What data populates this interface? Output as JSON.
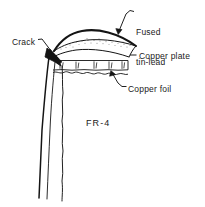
{
  "figure": {
    "background_color": "#ffffff",
    "ink_color": "#1a1a1a",
    "width": 205,
    "height": 207
  },
  "labels": {
    "fused_tin_lead_line1": "Fused",
    "fused_tin_lead_line2": "tin-lead",
    "copper_plate": "Copper plate",
    "copper_foil": "Copper foil",
    "crack": "Crack",
    "substrate": "FR-4"
  },
  "leader_lines": [
    {
      "name": "fused-tin-lead-leader",
      "from": [
        134,
        12
      ],
      "to": [
        119,
        32
      ],
      "arrow": true
    },
    {
      "name": "copper-plate-leader",
      "from": [
        137,
        55
      ],
      "to": [
        128,
        55
      ],
      "arrow": false
    },
    {
      "name": "copper-foil-leader",
      "from": [
        126,
        86
      ],
      "to": [
        111,
        72
      ],
      "arrow": true
    },
    {
      "name": "crack-leader",
      "from": [
        40,
        40
      ],
      "to": [
        53,
        54
      ],
      "arrow": false
    }
  ],
  "layers": [
    {
      "name": "fused-tin-lead",
      "fill": "#ffffff",
      "texture": "stipple"
    },
    {
      "name": "copper-plate",
      "fill": "#ffffff",
      "texture": "none"
    },
    {
      "name": "copper-foil",
      "fill": "#ffffff",
      "texture": "hatch-ticks"
    },
    {
      "name": "fr-4-substrate",
      "fill": "#ffffff",
      "texture": "none"
    }
  ],
  "crack": {
    "name": "crack-wedge",
    "fill": "#141414",
    "description": "dark wedge at barrel knee with two wavy fracture lines running down"
  }
}
